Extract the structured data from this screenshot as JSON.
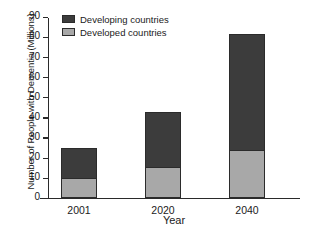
{
  "chart_data": {
    "type": "bar",
    "subtype": "stacked-bar",
    "title": "",
    "xlabel": "Year",
    "ylabel": "Number of People with Dementia (Millions)",
    "categories": [
      "2001",
      "2020",
      "2040"
    ],
    "series": [
      {
        "name": "Developed countries",
        "values": [
          10,
          15.5,
          24
        ],
        "color": "#a8a8a8"
      },
      {
        "name": "Developing countries",
        "values": [
          14.8,
          27.5,
          57.8
        ],
        "color": "#3c3c3c"
      }
    ],
    "totals": [
      24.8,
      43,
      81.8
    ],
    "ylim": [
      0,
      90
    ],
    "yticks": [
      0,
      10,
      20,
      30,
      40,
      50,
      60,
      70,
      80,
      90
    ],
    "ytick_labels": [
      "0",
      "10",
      "20",
      "30",
      "40",
      "50",
      "60",
      "70",
      "80",
      "90"
    ],
    "grid": false,
    "legend_position": "top-left",
    "legend": [
      {
        "label": "Developing countries",
        "color": "#3c3c3c"
      },
      {
        "label": "Developed countries",
        "color": "#a8a8a8"
      }
    ]
  }
}
